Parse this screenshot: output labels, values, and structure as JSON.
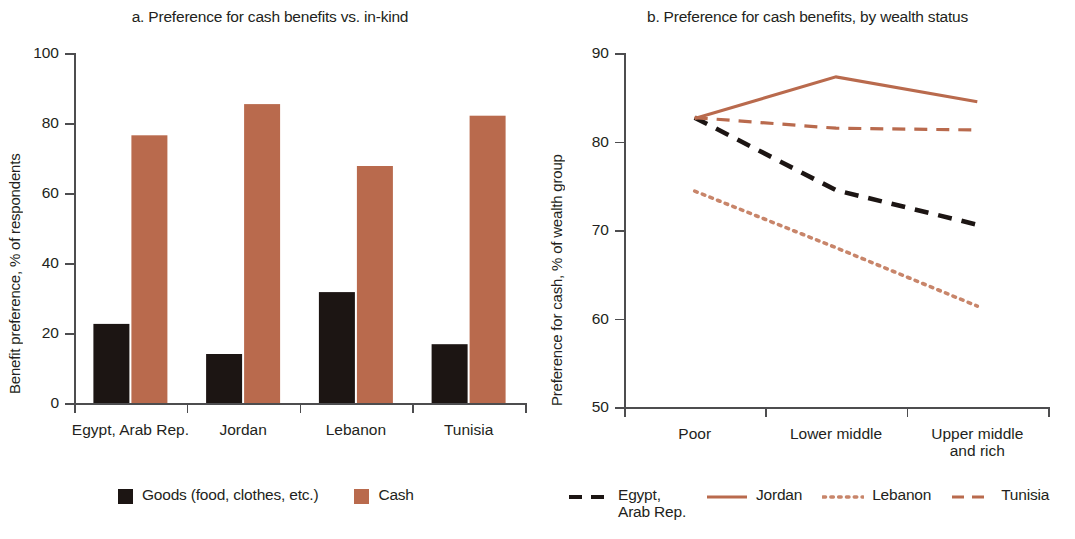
{
  "colors": {
    "cash": "#b96a4d",
    "goods": "#1c1513",
    "axis": "#4d4d4f",
    "text": "#231f20"
  },
  "panel_a": {
    "title": "a. Preference for cash benefits vs. in-kind",
    "ylabel": "Benefit preference, % of respondents",
    "ytick_labels": [
      "0",
      "20",
      "40",
      "60",
      "80",
      "100"
    ],
    "xtick_labels": [
      "Egypt, Arab Rep.",
      "Jordan",
      "Lebanon",
      "Tunisia"
    ],
    "legend": [
      {
        "label": "Goods (food, clothes, etc.)",
        "color": "#1c1513",
        "key": "square-swatch"
      },
      {
        "label": "Cash",
        "color": "#b96a4d",
        "key": "square-swatch"
      }
    ]
  },
  "panel_b": {
    "title": "b. Preference for cash benefits, by wealth status",
    "ylabel": "Preference for cash, % of wealth group",
    "ytick_labels": [
      "50",
      "60",
      "70",
      "80",
      "90"
    ],
    "xtick_labels": [
      "Poor",
      "Lower middle",
      "Upper middle\nand rich"
    ],
    "legend": [
      {
        "label": "Egypt,\nArab Rep.",
        "color": "#1c1513",
        "dash": "13,9",
        "width": 4.2,
        "key": "dashed-line-key"
      },
      {
        "label": "Jordan",
        "color": "#b96a4d",
        "dash": "none",
        "width": 3.0,
        "key": "solid-line-key"
      },
      {
        "label": "Lebanon",
        "color": "#c8856a",
        "dash": "2.6,5.2",
        "width": 3.4,
        "key": "dotted-line-key"
      },
      {
        "label": "Tunisia",
        "color": "#b96a4d",
        "dash": "12,8",
        "width": 3.0,
        "key": "dashed-line-key"
      }
    ]
  },
  "chart_data": [
    {
      "type": "bar",
      "panel": "a",
      "title": "a. Preference for cash benefits vs. in-kind",
      "xlabel": "",
      "ylabel": "Benefit preference, % of respondents",
      "categories": [
        "Egypt, Arab Rep.",
        "Jordan",
        "Lebanon",
        "Tunisia"
      ],
      "ylim": [
        0,
        100
      ],
      "yticks": [
        0,
        20,
        40,
        60,
        80,
        100
      ],
      "grid": false,
      "legend_position": "bottom",
      "series": [
        {
          "name": "Goods (food, clothes, etc.)",
          "color": "#1c1513",
          "values": [
            22.6,
            14.0,
            31.7,
            16.8
          ]
        },
        {
          "name": "Cash",
          "color": "#b96a4d",
          "values": [
            76.5,
            85.4,
            67.7,
            82.1
          ]
        }
      ]
    },
    {
      "type": "line",
      "panel": "b",
      "title": "b. Preference for cash benefits, by wealth status",
      "xlabel": "",
      "ylabel": "Preference for cash, % of wealth group",
      "categories": [
        "Poor",
        "Lower middle",
        "Upper middle and rich"
      ],
      "ylim": [
        50,
        90
      ],
      "yticks": [
        50,
        60,
        70,
        80,
        90
      ],
      "grid": false,
      "legend_position": "bottom",
      "series": [
        {
          "name": "Egypt, Arab Rep.",
          "color": "#1c1513",
          "style": "dashed",
          "values": [
            82.7,
            74.5,
            70.6
          ]
        },
        {
          "name": "Jordan",
          "color": "#b96a4d",
          "style": "solid",
          "values": [
            82.6,
            87.3,
            84.5
          ]
        },
        {
          "name": "Lebanon",
          "color": "#c8856a",
          "style": "dotted",
          "values": [
            74.4,
            68.0,
            61.4
          ]
        },
        {
          "name": "Tunisia",
          "color": "#b96a4d",
          "style": "dashed",
          "values": [
            82.7,
            81.5,
            81.3
          ]
        }
      ]
    }
  ]
}
